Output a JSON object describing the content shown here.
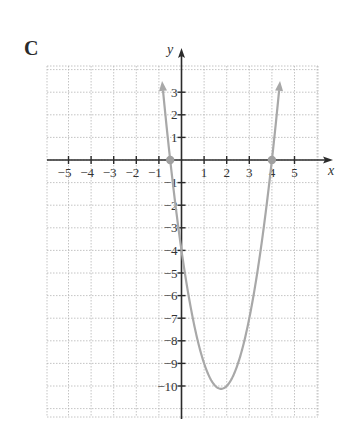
{
  "panel": {
    "label": "C"
  },
  "colors": {
    "axis": "#2b2b2b",
    "grid": "#b5b5b5",
    "curve": "#a8a8a8",
    "point": "#a0a0a0",
    "text": "#333333"
  },
  "chart_data": {
    "type": "line",
    "title": "C",
    "xlabel": "x",
    "ylabel": "y",
    "function": "y = 2x^2 - 7x - 4",
    "xlim": [
      -6,
      6
    ],
    "ylim": [
      -11,
      4
    ],
    "grid": true,
    "x_ticks": [
      -5,
      -4,
      -3,
      -2,
      -1,
      1,
      2,
      3,
      4,
      5
    ],
    "x_tick_labels": [
      "−5",
      "−4",
      "−3",
      "−2",
      "−1",
      "1",
      "2",
      "3",
      "4",
      "5"
    ],
    "y_ticks": [
      3,
      2,
      1,
      -1,
      -2,
      -3,
      -4,
      -5,
      -6,
      -7,
      -8,
      -9,
      -10
    ],
    "y_tick_labels": [
      "3",
      "2",
      "1",
      "−1",
      "−2",
      "−3",
      "−4",
      "−5",
      "−6",
      "−7",
      "−8",
      "−9",
      "−10"
    ],
    "series": [
      {
        "name": "parabola",
        "x": [
          -0.75,
          -0.5,
          0,
          0.5,
          1,
          1.5,
          1.75,
          2,
          2.5,
          3,
          3.5,
          4,
          4.25
        ],
        "y": [
          2.375,
          0,
          -4,
          -7,
          -9,
          -10,
          -10.125,
          -10,
          -9,
          -7,
          -4,
          0,
          2.375
        ]
      }
    ],
    "marked_points": [
      {
        "x": -0.5,
        "y": 0,
        "label": "x-intercept"
      },
      {
        "x": 4,
        "y": 0,
        "label": "x-intercept"
      }
    ],
    "vertex": {
      "x": 1.75,
      "y": -10.125
    },
    "y_intercept": -4
  }
}
